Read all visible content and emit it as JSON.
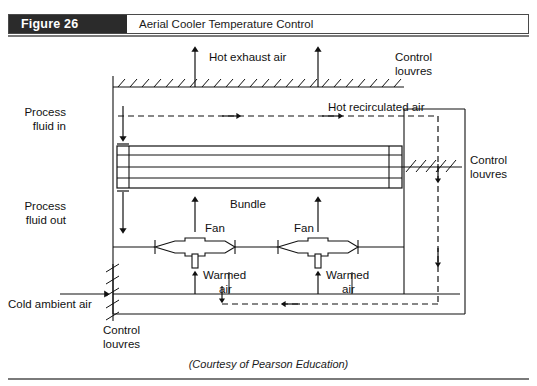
{
  "figure": {
    "number_label": "Figure 26",
    "title": "Aerial Cooler Temperature Control"
  },
  "footer": {
    "courtesy": "(Courtesy of Pearson Education)"
  },
  "diagram": {
    "type": "process-flow-schematic",
    "labels": {
      "hot_exhaust_air": "Hot exhaust air",
      "control_louvres_top": "Control",
      "control_louvres_top2": "louvres",
      "hot_recirculated_air": "Hot recirculated air",
      "process_fluid_in_1": "Process",
      "process_fluid_in_2": "fluid in",
      "process_fluid_out_1": "Process",
      "process_fluid_out_2": "fluid out",
      "bundle": "Bundle",
      "control_louvres_right_1": "Control",
      "control_louvres_right_2": "louvres",
      "fan_left": "Fan",
      "fan_right": "Fan",
      "warmed_air_left_1": "Warmed",
      "warmed_air_left_2": "air",
      "warmed_air_right_1": "Warmed",
      "warmed_air_right_2": "air",
      "cold_ambient_air": "Cold ambient air",
      "control_louvres_bottom_1": "Control",
      "control_louvres_bottom_2": "louvres"
    },
    "colors": {
      "line": "#111111",
      "bundle_fill": "#ffffff",
      "dashed": "#111111",
      "header_block": "#2b2b2b"
    }
  }
}
